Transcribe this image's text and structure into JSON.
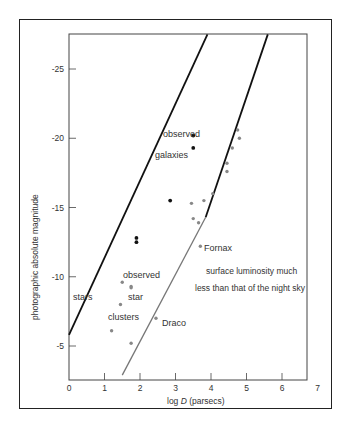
{
  "chart_data": {
    "type": "scatter",
    "title": "",
    "xlabel": "log D (parsecs)",
    "ylabel": "photographic absolute magnitude",
    "xlim": [
      0,
      7
    ],
    "ylim": [
      -2.6,
      -27.5
    ],
    "x_ticks": [
      "0",
      "1",
      "2",
      "3",
      "4",
      "5",
      "6",
      "7"
    ],
    "y_ticks": [
      "-25",
      "-20",
      "-15",
      "-10",
      "-5"
    ],
    "grid": false,
    "lines": [
      {
        "name": "upper-boundary-black",
        "color": "#111111",
        "points": [
          [
            0,
            -5.8
          ],
          [
            3.9,
            -27.5
          ]
        ]
      },
      {
        "name": "lower-boundary-black",
        "color": "#111111",
        "points": [
          [
            3.85,
            -14.3
          ],
          [
            5.6,
            -27.5
          ]
        ]
      },
      {
        "name": "lower-boundary-grey",
        "color": "#777777",
        "points": [
          [
            1.5,
            -2.9
          ],
          [
            3.85,
            -14.3
          ]
        ]
      }
    ],
    "series": [
      {
        "name": "observed galaxies (black)",
        "color": "#111111",
        "points": [
          [
            3.5,
            -20.2
          ],
          [
            3.5,
            -19.3
          ],
          [
            2.85,
            -15.5
          ],
          [
            1.9,
            -12.8
          ],
          [
            1.9,
            -12.5
          ]
        ]
      },
      {
        "name": "observed galaxies (grey)",
        "color": "#888888",
        "points": [
          [
            4.75,
            -20.6
          ],
          [
            4.8,
            -20.0
          ],
          [
            4.6,
            -19.3
          ],
          [
            4.45,
            -18.2
          ],
          [
            4.45,
            -17.6
          ],
          [
            4.05,
            -16.0
          ],
          [
            3.8,
            -15.5
          ],
          [
            3.45,
            -15.3
          ],
          [
            3.5,
            -14.2
          ],
          [
            3.65,
            -13.9
          ],
          [
            3.7,
            -12.2
          ]
        ]
      },
      {
        "name": "observed star clusters",
        "color": "#888888",
        "points": [
          [
            1.5,
            -9.6
          ],
          [
            1.75,
            -9.3
          ],
          [
            1.75,
            -9.2
          ],
          [
            1.45,
            -8.0
          ],
          [
            1.2,
            -6.1
          ],
          [
            1.75,
            -5.2
          ],
          [
            2.45,
            -7.0
          ]
        ]
      }
    ],
    "annotations": [
      "observed",
      "galaxies",
      "Fornax",
      "surface luminosity much",
      "less than that of the night sky",
      "observed",
      "star",
      "clusters",
      "stars",
      "Draco"
    ]
  },
  "labels": {
    "observed_galaxies_1": "observed",
    "observed_galaxies_2": "galaxies",
    "fornax": "Fornax",
    "surface_1": "surface luminosity much",
    "surface_2": "less than that of the night sky",
    "observed_clusters_1": "observed",
    "observed_clusters_2": "star",
    "observed_clusters_3": "clusters",
    "stars": "stars",
    "draco": "Draco",
    "xlabel_prefix": "log ",
    "xlabel_var": "D",
    "xlabel_suffix": " (parsecs)",
    "ylabel": "photographic absolute magnitude",
    "caption": "Fig. 8.14 ... (truncated)"
  },
  "ticks": {
    "x": [
      "0",
      "1",
      "2",
      "3",
      "4",
      "5",
      "6",
      "7"
    ],
    "y": [
      "-25",
      "-20",
      "-15",
      "-10",
      "-5"
    ]
  }
}
